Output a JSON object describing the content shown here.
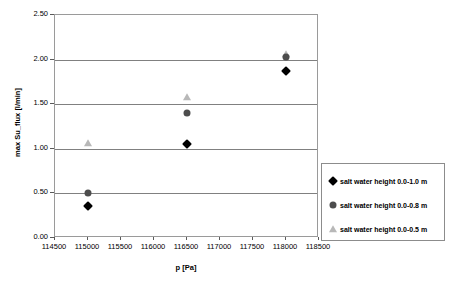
{
  "chart_data": {
    "type": "scatter",
    "title": "",
    "xlabel": "p [Pa]",
    "ylabel": "max Su_flux [l/min]",
    "xlim": [
      114500,
      118500
    ],
    "ylim": [
      0.0,
      2.5
    ],
    "xticks": [
      114500,
      115000,
      115500,
      116000,
      116500,
      117000,
      117500,
      118000,
      118500
    ],
    "xtick_labels": [
      "114500",
      "115000",
      "115500",
      "116000",
      "116500",
      "117000",
      "117500",
      "118000",
      "118500"
    ],
    "yticks": [
      0.0,
      0.5,
      1.0,
      1.5,
      2.0,
      2.5
    ],
    "ytick_labels": [
      "0.00",
      "0.50",
      "1.00",
      "1.50",
      "2.00",
      "2.50"
    ],
    "gridlines_y": [
      0.5,
      1.0,
      1.5,
      2.0
    ],
    "grid": "horizontal",
    "legend_position": "right",
    "x": [
      115000,
      116500,
      118000
    ],
    "series": [
      {
        "name": "salt water height 0.0-1.0 m",
        "marker": "diamond",
        "color": "#000000",
        "values": [
          0.36,
          1.05,
          1.87
        ]
      },
      {
        "name": "salt water height 0.0-0.8 m",
        "marker": "circle",
        "color": "#4d4d4d",
        "values": [
          0.5,
          1.4,
          2.03
        ]
      },
      {
        "name": "salt water height 0.0-0.5 m",
        "marker": "triangle",
        "color": "#b8b8b8",
        "values": [
          1.07,
          1.58,
          2.06
        ]
      }
    ]
  },
  "legend": {
    "entries": [
      "salt water height 0.0-1.0 m",
      "salt water height 0.0-0.8 m",
      "salt water height 0.0-0.5 m"
    ]
  }
}
